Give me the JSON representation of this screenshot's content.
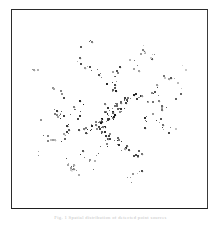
{
  "figure": {
    "caption": "Fig. 1  Spatial distribution of detected point sources",
    "background_color": "#ffffff",
    "frame": {
      "border_color": "#2b2b2b",
      "border_width_px": 1,
      "left_px": 11,
      "top_px": 9,
      "width_px": 197,
      "height_px": 200
    }
  },
  "chart_data": {
    "type": "scatter",
    "title": "",
    "subtitle": "",
    "xlabel": "",
    "ylabel": "",
    "xlim": [
      0,
      1
    ],
    "ylim": [
      0,
      1
    ],
    "xticks": [],
    "yticks": [],
    "xticklabels": [],
    "yticklabels": [],
    "grid": false,
    "legend": false,
    "legend_position": "none",
    "annotations": [],
    "marker": "square",
    "marker_size_px": [
      1,
      2
    ],
    "n_points": 402,
    "point_color_min": "#101010",
    "point_color_max": "#d8d8d8",
    "density_profile": "radial-gaussian",
    "density_center": [
      0.5,
      0.52
    ],
    "density_sigma": 0.27,
    "series": [
      {
        "name": "point sources",
        "color": "#333333",
        "x": [
          0.501,
          0.462,
          0.548,
          0.391,
          0.612,
          0.447,
          0.559,
          0.508,
          0.356,
          0.664,
          0.478,
          0.532,
          0.423,
          0.587,
          0.495,
          0.441,
          0.569,
          0.514,
          0.382,
          0.638,
          0.47,
          0.526,
          0.409,
          0.601,
          0.487,
          0.453,
          0.553,
          0.52,
          0.368,
          0.651,
          0.484,
          0.539,
          0.431,
          0.575,
          0.499,
          0.458,
          0.561,
          0.505,
          0.394,
          0.627,
          0.473,
          0.53,
          0.415,
          0.593,
          0.491,
          0.449,
          0.557,
          0.517,
          0.375,
          0.643,
          0.481,
          0.535,
          0.427,
          0.581,
          0.496,
          0.455,
          0.565,
          0.511,
          0.388,
          0.633,
          0.467,
          0.523,
          0.419,
          0.597,
          0.493,
          0.445,
          0.551,
          0.522,
          0.371,
          0.647,
          0.476,
          0.541,
          0.435,
          0.571,
          0.502,
          0.461,
          0.563,
          0.507,
          0.397,
          0.621,
          0.309,
          0.712,
          0.276,
          0.745,
          0.334,
          0.688,
          0.291,
          0.729,
          0.318,
          0.701,
          0.264,
          0.757,
          0.342,
          0.676,
          0.283,
          0.736,
          0.326,
          0.694,
          0.271,
          0.751,
          0.352,
          0.668,
          0.298,
          0.722,
          0.315,
          0.707,
          0.259,
          0.763,
          0.338,
          0.682,
          0.287,
          0.733,
          0.322,
          0.698,
          0.267,
          0.748,
          0.346,
          0.672,
          0.294,
          0.726,
          0.228,
          0.789,
          0.195,
          0.812,
          0.241,
          0.776,
          0.208,
          0.803,
          0.251,
          0.768,
          0.184,
          0.826,
          0.236,
          0.781,
          0.201,
          0.798,
          0.246,
          0.772,
          0.189,
          0.819,
          0.158,
          0.845,
          0.172,
          0.834,
          0.146,
          0.858,
          0.165,
          0.841,
          0.137,
          0.866,
          0.124,
          0.876,
          0.151,
          0.849,
          0.131,
          0.871,
          0.118,
          0.883,
          0.143,
          0.855,
          0.512,
          0.488,
          0.534,
          0.466,
          0.521,
          0.479,
          0.543,
          0.457,
          0.528,
          0.472,
          0.556,
          0.444,
          0.509,
          0.491,
          0.537,
          0.463,
          0.518,
          0.482,
          0.547,
          0.453,
          0.605,
          0.395,
          0.618,
          0.382,
          0.592,
          0.408,
          0.631,
          0.369,
          0.584,
          0.416,
          0.644,
          0.356,
          0.598,
          0.402,
          0.625,
          0.375,
          0.611,
          0.389,
          0.637,
          0.363,
          0.678,
          0.322,
          0.691,
          0.309,
          0.665,
          0.335,
          0.704,
          0.296,
          0.658,
          0.342,
          0.717,
          0.283,
          0.672,
          0.328,
          0.698,
          0.302,
          0.685,
          0.315,
          0.711,
          0.289,
          0.384,
          0.616,
          0.371,
          0.629,
          0.398,
          0.602,
          0.359,
          0.641,
          0.405,
          0.595,
          0.347,
          0.653,
          0.392,
          0.608,
          0.365,
          0.635,
          0.378,
          0.622,
          0.353,
          0.647,
          0.754,
          0.246,
          0.768,
          0.232,
          0.741,
          0.259,
          0.781,
          0.219,
          0.734,
          0.266,
          0.794,
          0.206,
          0.748,
          0.252,
          0.775,
          0.225,
          0.761,
          0.239,
          0.788,
          0.212,
          0.214,
          0.786,
          0.227,
          0.773,
          0.201,
          0.799,
          0.241,
          0.759,
          0.194,
          0.806,
          0.254,
          0.746,
          0.208,
          0.792,
          0.234,
          0.766,
          0.221,
          0.779,
          0.247,
          0.753,
          0.818,
          0.182,
          0.831,
          0.169,
          0.805,
          0.195,
          0.844,
          0.156,
          0.798,
          0.202,
          0.857,
          0.143,
          0.812,
          0.188,
          0.838,
          0.162,
          0.825,
          0.175,
          0.851,
          0.149,
          0.096,
          0.904,
          0.109,
          0.891,
          0.083,
          0.917,
          0.122,
          0.878,
          0.076,
          0.924,
          0.135,
          0.865,
          0.089,
          0.911,
          0.116,
          0.884,
          0.102,
          0.898,
          0.128,
          0.872,
          0.462,
          0.538,
          0.485,
          0.515,
          0.471,
          0.529,
          0.494,
          0.506,
          0.457,
          0.543,
          0.503,
          0.497,
          0.476,
          0.524,
          0.489,
          0.511,
          0.468,
          0.532,
          0.498,
          0.502,
          0.552,
          0.448,
          0.566,
          0.434,
          0.541,
          0.459,
          0.578,
          0.422,
          0.535,
          0.465,
          0.589,
          0.411,
          0.558,
          0.442,
          0.572,
          0.428,
          0.545,
          0.455,
          0.583,
          0.417,
          0.627,
          0.373,
          0.641,
          0.359,
          0.615,
          0.385,
          0.654,
          0.346,
          0.608,
          0.392,
          0.667,
          0.333,
          0.621,
          0.379,
          0.648,
          0.352,
          0.634,
          0.366,
          0.661,
          0.339,
          0.298,
          0.702,
          0.312,
          0.688,
          0.285,
          0.715,
          0.325,
          0.675,
          0.279,
          0.721,
          0.338,
          0.662,
          0.292,
          0.708,
          0.318,
          0.682,
          0.305,
          0.695,
          0.331,
          0.669
        ],
        "y": [
          0.512,
          0.558,
          0.471,
          0.603,
          0.436,
          0.585,
          0.494,
          0.529,
          0.621,
          0.447,
          0.546,
          0.483,
          0.572,
          0.462,
          0.518,
          0.595,
          0.455,
          0.537,
          0.609,
          0.429,
          0.553,
          0.476,
          0.588,
          0.441,
          0.524,
          0.567,
          0.498,
          0.532,
          0.614,
          0.452,
          0.541,
          0.487,
          0.579,
          0.465,
          0.515,
          0.591,
          0.459,
          0.534,
          0.606,
          0.433,
          0.549,
          0.479,
          0.583,
          0.444,
          0.521,
          0.562,
          0.501,
          0.527,
          0.617,
          0.449,
          0.544,
          0.491,
          0.575,
          0.468,
          0.509,
          0.598,
          0.453,
          0.531,
          0.602,
          0.438,
          0.556,
          0.473,
          0.586,
          0.447,
          0.517,
          0.565,
          0.504,
          0.523,
          0.612,
          0.456,
          0.539,
          0.494,
          0.577,
          0.461,
          0.506,
          0.593,
          0.466,
          0.528,
          0.599,
          0.442,
          0.487,
          0.523,
          0.612,
          0.398,
          0.541,
          0.465,
          0.578,
          0.432,
          0.507,
          0.569,
          0.624,
          0.386,
          0.553,
          0.451,
          0.592,
          0.419,
          0.496,
          0.581,
          0.636,
          0.374,
          0.462,
          0.538,
          0.604,
          0.409,
          0.529,
          0.477,
          0.648,
          0.362,
          0.515,
          0.556,
          0.591,
          0.422,
          0.484,
          0.545,
          0.631,
          0.379,
          0.472,
          0.563,
          0.598,
          0.406,
          0.455,
          0.572,
          0.668,
          0.341,
          0.518,
          0.489,
          0.642,
          0.367,
          0.533,
          0.476,
          0.684,
          0.325,
          0.502,
          0.545,
          0.656,
          0.354,
          0.526,
          0.481,
          0.671,
          0.338,
          0.418,
          0.608,
          0.697,
          0.312,
          0.563,
          0.443,
          0.712,
          0.298,
          0.579,
          0.426,
          0.726,
          0.285,
          0.554,
          0.458,
          0.709,
          0.301,
          0.738,
          0.272,
          0.568,
          0.439,
          0.348,
          0.672,
          0.316,
          0.704,
          0.362,
          0.658,
          0.303,
          0.717,
          0.335,
          0.685,
          0.289,
          0.731,
          0.354,
          0.666,
          0.322,
          0.698,
          0.341,
          0.679,
          0.296,
          0.724,
          0.256,
          0.764,
          0.269,
          0.751,
          0.243,
          0.777,
          0.282,
          0.738,
          0.235,
          0.785,
          0.295,
          0.725,
          0.248,
          0.772,
          0.274,
          0.746,
          0.261,
          0.759,
          0.288,
          0.732,
          0.214,
          0.806,
          0.227,
          0.793,
          0.201,
          0.819,
          0.239,
          0.781,
          0.194,
          0.826,
          0.252,
          0.768,
          0.207,
          0.813,
          0.233,
          0.787,
          0.22,
          0.8,
          0.245,
          0.775,
          0.176,
          0.844,
          0.189,
          0.831,
          0.163,
          0.857,
          0.202,
          0.818,
          0.156,
          0.864,
          0.215,
          0.805,
          0.169,
          0.851,
          0.195,
          0.825,
          0.182,
          0.838,
          0.208,
          0.812,
          0.458,
          0.532,
          0.471,
          0.519,
          0.445,
          0.545,
          0.484,
          0.506,
          0.438,
          0.552,
          0.497,
          0.493,
          0.451,
          0.539,
          0.477,
          0.513,
          0.464,
          0.526,
          0.49,
          0.5,
          0.398,
          0.592,
          0.411,
          0.579,
          0.385,
          0.605,
          0.424,
          0.566,
          0.378,
          0.612,
          0.437,
          0.553,
          0.391,
          0.599,
          0.417,
          0.573,
          0.404,
          0.586,
          0.43,
          0.56,
          0.338,
          0.652,
          0.351,
          0.639,
          0.325,
          0.665,
          0.364,
          0.626,
          0.318,
          0.672,
          0.377,
          0.613,
          0.331,
          0.659,
          0.357,
          0.633,
          0.344,
          0.646,
          0.37,
          0.62,
          0.278,
          0.712,
          0.291,
          0.699,
          0.265,
          0.725,
          0.304,
          0.686,
          0.258,
          0.732,
          0.317,
          0.673,
          0.271,
          0.719,
          0.297,
          0.693,
          0.284,
          0.706,
          0.31,
          0.68,
          0.604,
          0.396,
          0.617,
          0.383,
          0.591,
          0.409,
          0.63,
          0.37,
          0.584,
          0.416,
          0.643,
          0.357,
          0.597,
          0.403,
          0.623,
          0.377,
          0.61,
          0.39,
          0.636,
          0.364,
          0.664,
          0.336,
          0.677,
          0.323,
          0.651,
          0.349,
          0.69,
          0.31,
          0.644,
          0.356,
          0.703,
          0.297,
          0.657,
          0.343,
          0.683,
          0.317,
          0.67,
          0.33,
          0.696,
          0.304,
          0.724,
          0.276,
          0.737,
          0.263,
          0.711,
          0.289,
          0.75,
          0.25,
          0.704,
          0.296,
          0.763,
          0.237,
          0.717,
          0.283,
          0.743,
          0.257,
          0.73,
          0.27,
          0.756,
          0.244,
          0.784,
          0.216,
          0.797,
          0.203,
          0.771,
          0.229,
          0.81,
          0.19,
          0.764,
          0.236,
          0.823,
          0.177,
          0.777,
          0.223,
          0.803,
          0.197,
          0.79,
          0.21,
          0.816,
          0.184
        ]
      }
    ]
  }
}
